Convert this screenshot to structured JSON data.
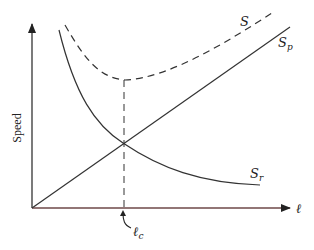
{
  "diagram": {
    "y_axis_label": "Speed",
    "x_axis_label": "ℓ",
    "critical_label_main": "ℓ",
    "critical_label_sub": "c",
    "curves": [
      {
        "name": "S",
        "label_main": "S",
        "label_sub": "",
        "style": "dashed",
        "shape": "U-shaped total, minimum at ℓc"
      },
      {
        "name": "Sp",
        "label_main": "S",
        "label_sub": "p",
        "style": "solid",
        "shape": "straight line increasing from origin"
      },
      {
        "name": "Sr",
        "label_main": "S",
        "label_sub": "r",
        "style": "solid",
        "shape": "decreasing hyperbola"
      }
    ],
    "colors": {
      "line": "#333333",
      "x_axis": "#8a3a3a"
    }
  }
}
